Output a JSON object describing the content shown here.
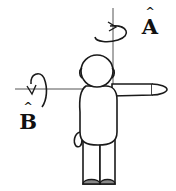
{
  "diagram": {
    "axes": [
      {
        "id": "A",
        "label": "A",
        "hat": "^",
        "orientation": "vertical",
        "rotation": "counter-clockwise arrow around vertical axis"
      },
      {
        "id": "B",
        "label": "B",
        "hat": "^",
        "orientation": "horizontal",
        "rotation": "arrow around horizontal axis"
      }
    ],
    "colors": {
      "line": "#1a1a1a",
      "background": "#ffffff",
      "axis": "#555555"
    }
  }
}
